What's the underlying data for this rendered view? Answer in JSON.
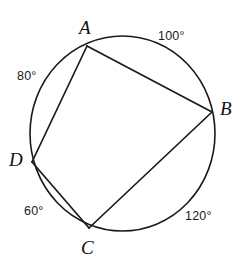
{
  "figure": {
    "width": 243,
    "height": 266,
    "background_color": "#ffffff",
    "stroke_color": "#1a1a1a"
  },
  "circle": {
    "name": "circumscribed-circle",
    "center_x": 122.5,
    "center_y": 133.5,
    "radius_x": 92.5,
    "radius_y": 97.5,
    "stroke_width": 1.6
  },
  "vertices": [
    {
      "id": "A",
      "label": "A",
      "x": 87,
      "y": 46,
      "label_x": 79,
      "label_y": 18
    },
    {
      "id": "B",
      "label": "B",
      "x": 212,
      "y": 112,
      "label_x": 220,
      "label_y": 99
    },
    {
      "id": "C",
      "label": "C",
      "x": 89,
      "y": 228,
      "label_x": 81,
      "label_y": 238
    },
    {
      "id": "D",
      "label": "D",
      "x": 32,
      "y": 162,
      "label_x": 9,
      "label_y": 150
    }
  ],
  "chords": [
    {
      "id": "AB",
      "from": "A",
      "to": "B",
      "x1": 87,
      "y1": 46,
      "x2": 212,
      "y2": 112
    },
    {
      "id": "BC",
      "from": "B",
      "to": "C",
      "x1": 212,
      "y1": 112,
      "x2": 89,
      "y2": 228
    },
    {
      "id": "CD",
      "from": "C",
      "to": "D",
      "x1": 89,
      "y1": 228,
      "x2": 32,
      "y2": 162
    },
    {
      "id": "DA",
      "from": "D",
      "to": "A",
      "x1": 32,
      "y1": 162,
      "x2": 87,
      "y2": 46
    }
  ],
  "arc_measures": [
    {
      "id": "arc-AB",
      "label": "100°",
      "value": 100,
      "unit": "degrees",
      "between": "A to B",
      "x": 158,
      "y": 30
    },
    {
      "id": "arc-BC",
      "label": "120°",
      "value": 120,
      "unit": "degrees",
      "between": "B to C",
      "x": 185,
      "y": 210
    },
    {
      "id": "arc-CD",
      "label": "60°",
      "value": 60,
      "unit": "degrees",
      "between": "C to D",
      "x": 24,
      "y": 205
    },
    {
      "id": "arc-DA",
      "label": "80°",
      "value": 80,
      "unit": "degrees",
      "between": "D to A",
      "x": 17,
      "y": 70
    }
  ]
}
